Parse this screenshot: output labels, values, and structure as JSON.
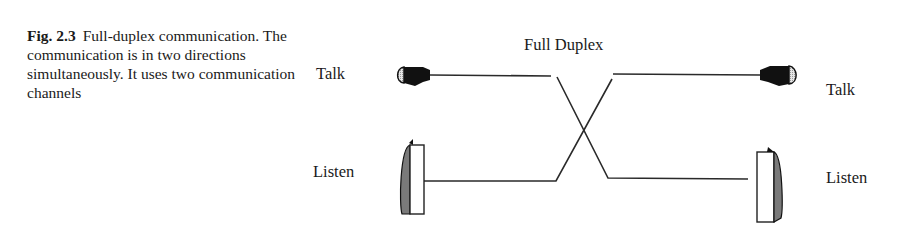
{
  "caption": {
    "label": "Fig. 2.3",
    "text": "Full-duplex communication. The communication is in two directions simultaneously. It uses two communication channels"
  },
  "diagram": {
    "title": "Full Duplex",
    "left": {
      "talk_label": "Talk",
      "listen_label": "Listen"
    },
    "right": {
      "talk_label": "Talk",
      "listen_label": "Listen"
    },
    "colors": {
      "line": "#2a2a2a",
      "fill_dark": "#111111",
      "fill_shade": "#7a7a7a",
      "fill_light": "#d8d8d8"
    }
  }
}
